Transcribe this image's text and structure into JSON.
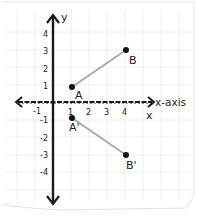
{
  "diagram": {
    "axes": {
      "y_label": "y",
      "x_label": "x-axis",
      "x_label_secondary": "x",
      "x_ticks": [
        "-1",
        "1",
        "2",
        "3",
        "4"
      ],
      "y_ticks": [
        "4",
        "3",
        "2",
        "1",
        "-1",
        "-2",
        "-3",
        "-4"
      ]
    },
    "points": [
      {
        "label": "A",
        "x": 1,
        "y": 1
      },
      {
        "label": "B",
        "x": 4,
        "y": 3
      },
      {
        "label": "A'",
        "x": 1,
        "y": -1
      },
      {
        "label": "B'",
        "x": 4,
        "y": -3
      }
    ],
    "segments": [
      {
        "from": "A",
        "to": "B"
      },
      {
        "from": "A'",
        "to": "B'"
      }
    ],
    "colors": {
      "axis": "#1a1a1a",
      "segment": "#a8a8a8",
      "point": "#111111",
      "grid": "#eeeeee",
      "paper_edge": "#e2e2e2"
    }
  }
}
